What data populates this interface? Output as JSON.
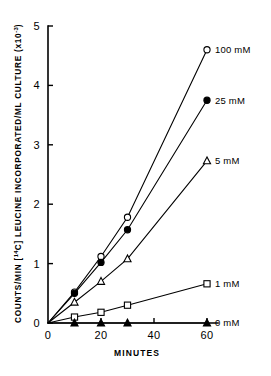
{
  "chart_data": {
    "type": "line",
    "title": "",
    "xlabel": "MINUTES",
    "ylabel": "COUNTS/MIN [14C] LEUCINE INCORPORATED/ML CULTURE (x10-3)",
    "ylabel_parts": {
      "prefix": "COUNTS/MIN [",
      "isotope_sup": "14",
      "isotope_element": "C",
      "middle": "] LEUCINE INCORPORATED/ML CULTURE  (x10",
      "exponent": "-3",
      "suffix": ")"
    },
    "x": [
      0,
      10,
      20,
      30,
      60
    ],
    "xlim": [
      0,
      63
    ],
    "ylim": [
      0,
      5
    ],
    "xticks": [
      0,
      20,
      40,
      60
    ],
    "xtick_labels": [
      "0",
      "20",
      "40",
      "60"
    ],
    "yticks": [
      0,
      1,
      2,
      3,
      4,
      5
    ],
    "ytick_labels": [
      "0",
      "1",
      "2",
      "3",
      "4",
      "5"
    ],
    "grid": false,
    "legend_position": "right-inline",
    "series": [
      {
        "name": "100 mM",
        "label": "100 mM",
        "marker": "open-circle",
        "color": "#000000",
        "values": [
          0,
          0.52,
          1.12,
          1.78,
          4.6
        ]
      },
      {
        "name": "25 mM",
        "label": "25 mM",
        "marker": "filled-circle",
        "color": "#000000",
        "values": [
          0,
          0.5,
          1.02,
          1.57,
          3.75
        ]
      },
      {
        "name": "5 mM",
        "label": "5 mM",
        "marker": "open-triangle",
        "color": "#000000",
        "values": [
          0,
          0.35,
          0.7,
          1.08,
          2.73
        ]
      },
      {
        "name": "1 mM",
        "label": "1 mM",
        "marker": "open-square",
        "color": "#000000",
        "values": [
          0,
          0.1,
          0.18,
          0.3,
          0.66
        ]
      },
      {
        "name": "0 mM",
        "label": "0 mM",
        "marker": "filled-triangle",
        "color": "#000000",
        "values": [
          0,
          0.0,
          0.0,
          0.0,
          0.0
        ]
      }
    ]
  }
}
